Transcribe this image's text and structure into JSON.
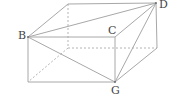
{
  "diagram": {
    "type": "cuboid-3d",
    "labels": {
      "B": "B",
      "C": "C",
      "D": "D",
      "G": "G"
    },
    "vertices": {
      "top_back_left": [
        68,
        4
      ],
      "D": [
        156,
        3
      ],
      "B": [
        28,
        37
      ],
      "C": [
        115,
        37
      ],
      "bottom_back_left": [
        68,
        48
      ],
      "bottom_back_right": [
        157,
        48
      ],
      "bottom_front_left": [
        28,
        82
      ],
      "G": [
        115,
        82
      ]
    },
    "solid_edges": [
      [
        "top_back_left",
        "D"
      ],
      [
        "B",
        "top_back_left"
      ],
      [
        "B",
        "C"
      ],
      [
        "C",
        "D"
      ],
      [
        "B",
        "bottom_front_left"
      ],
      [
        "C",
        "G"
      ],
      [
        "bottom_front_left",
        "G"
      ],
      [
        "D",
        "bottom_back_right"
      ],
      [
        "bottom_back_right",
        "G"
      ],
      [
        "B",
        "D"
      ],
      [
        "B",
        "G"
      ],
      [
        "D",
        "G"
      ]
    ],
    "hidden_edges": [
      [
        "top_back_left",
        "bottom_back_left"
      ],
      [
        "bottom_back_left",
        "bottom_back_right"
      ],
      [
        "bottom_back_left",
        "bottom_front_left"
      ]
    ],
    "colors": {
      "edge": "#a8a8a8",
      "hidden_edge": "#b4b4b4",
      "label": "#444444",
      "background": "#ffffff"
    }
  }
}
